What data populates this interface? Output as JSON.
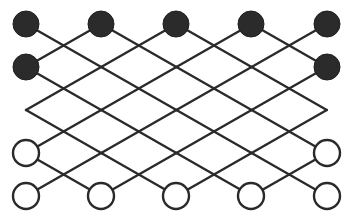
{
  "diagram": {
    "type": "diamond-lattice-network",
    "width": 349,
    "height": 217,
    "grid": {
      "origin_x": 26,
      "origin_y": 24,
      "step_x": 37.6,
      "step_y": 21.5,
      "columns": 9,
      "rows": 9
    },
    "colors": {
      "background": "#ffffff",
      "line": "#2a2a2a",
      "filled_node": "#2b2b2b",
      "hollow_node_fill": "#ffffff"
    },
    "node_radius": 13,
    "nodes": [
      {
        "id": "t1",
        "kind": "filled",
        "x": 26,
        "y": 24
      },
      {
        "id": "t2",
        "kind": "filled",
        "x": 101,
        "y": 24
      },
      {
        "id": "t3",
        "kind": "filled",
        "x": 176,
        "y": 24
      },
      {
        "id": "t4",
        "kind": "filled",
        "x": 251,
        "y": 24
      },
      {
        "id": "t5",
        "kind": "filled",
        "x": 327,
        "y": 24
      },
      {
        "id": "s1",
        "kind": "filled",
        "x": 26,
        "y": 67
      },
      {
        "id": "s2",
        "kind": "filled",
        "x": 327,
        "y": 67
      },
      {
        "id": "h1",
        "kind": "hollow",
        "x": 26,
        "y": 153
      },
      {
        "id": "h2",
        "kind": "hollow",
        "x": 327,
        "y": 153
      },
      {
        "id": "b1",
        "kind": "hollow",
        "x": 26,
        "y": 196
      },
      {
        "id": "b2",
        "kind": "hollow",
        "x": 101,
        "y": 196
      },
      {
        "id": "b3",
        "kind": "hollow",
        "x": 176,
        "y": 196
      },
      {
        "id": "b4",
        "kind": "hollow",
        "x": 251,
        "y": 196
      },
      {
        "id": "b5",
        "kind": "hollow",
        "x": 327,
        "y": 196
      }
    ]
  }
}
